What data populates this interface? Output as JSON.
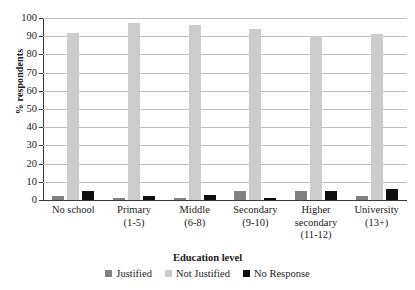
{
  "chart_data": {
    "type": "bar",
    "title": "",
    "xlabel": "Education level",
    "ylabel": "% respondents",
    "ylim": [
      0,
      100
    ],
    "ytick_interval": 10,
    "yticks": [
      0,
      10,
      20,
      30,
      40,
      50,
      60,
      70,
      80,
      90,
      100
    ],
    "grid": true,
    "legend_position": "bottom",
    "categories": [
      "No school",
      "Primary (1-5)",
      "Middle (6-8)",
      "Secondary (9-10)",
      "Higher secondary (11-12)",
      "University (13+)"
    ],
    "category_lines": [
      [
        "No school"
      ],
      [
        "Primary",
        "(1-5)"
      ],
      [
        "Middle",
        "(6-8)"
      ],
      [
        "Secondary",
        "(9-10)"
      ],
      [
        "Higher",
        "secondary",
        "(11-12)"
      ],
      [
        "University",
        "(13+)"
      ]
    ],
    "series": [
      {
        "name": "Justified",
        "color": "#808080",
        "values": [
          2,
          1,
          1,
          5,
          5,
          2
        ]
      },
      {
        "name": "Not Justified",
        "color": "#cccccc",
        "values": [
          92,
          97,
          96,
          94,
          90,
          91
        ]
      },
      {
        "name": "No Response",
        "color": "#0d0d0d",
        "values": [
          5,
          2,
          3,
          1,
          5,
          6
        ]
      }
    ]
  },
  "axis": {
    "y_title": "% respondents",
    "x_title": "Education level",
    "ytick_labels": [
      "100",
      "90",
      "80",
      "70",
      "60",
      "50",
      "40",
      "30",
      "20",
      "10",
      "0"
    ]
  },
  "legend": {
    "entries": [
      {
        "label": "Justified",
        "color": "#808080"
      },
      {
        "label": "Not Justified",
        "color": "#cccccc"
      },
      {
        "label": "No Response",
        "color": "#0d0d0d"
      }
    ]
  }
}
